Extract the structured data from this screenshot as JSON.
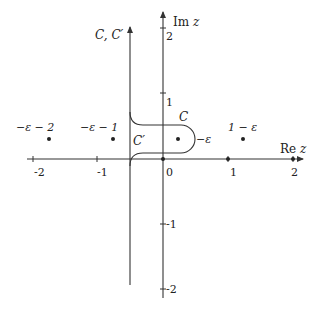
{
  "diagram": {
    "axes": {
      "x_label_prefix": "Re",
      "x_label_var": "z",
      "y_label_prefix": "Im",
      "y_label_var": "z",
      "x_ticks": [
        {
          "value": -2,
          "label": "-2"
        },
        {
          "value": -1,
          "label": "-1"
        },
        {
          "value": 0,
          "label": "0"
        },
        {
          "value": 1,
          "label": "1"
        },
        {
          "value": 2,
          "label": "2"
        }
      ],
      "y_ticks": [
        {
          "value": 2,
          "label": "2"
        },
        {
          "value": 1,
          "label": "1"
        },
        {
          "value": -1,
          "label": "-1"
        },
        {
          "value": -2,
          "label": "-2"
        }
      ]
    },
    "contours": {
      "vertical_label": "C, C′",
      "c_label": "C",
      "c_prime_label": "C′"
    },
    "points": [
      {
        "label": "−ε − 2",
        "x": -2.25,
        "y": 0.3
      },
      {
        "label": "−ε − 1",
        "x": -1.25,
        "y": 0.3
      },
      {
        "label": "−ε",
        "x": 0.23,
        "y": 0.3
      },
      {
        "label": "1 − ε",
        "x": 1.23,
        "y": 0.3
      }
    ],
    "colors": {
      "axis": "#333333",
      "contour": "#333333",
      "text": "#222222"
    }
  }
}
